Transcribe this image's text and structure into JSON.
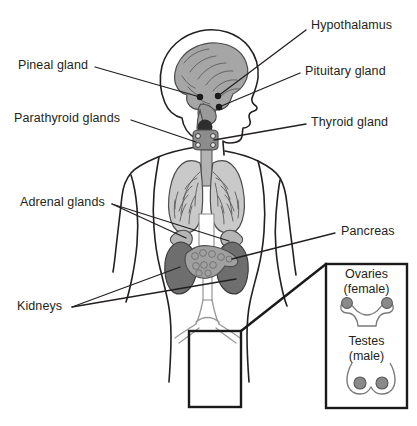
{
  "figure": {
    "type": "anatomical-diagram",
    "background_color": "#ffffff",
    "line_color": "#231f20",
    "text_color": "#231f20"
  },
  "labels": {
    "hypothalamus": "Hypothalamus",
    "pituitary_gland": "Pituitary gland",
    "thyroid_gland": "Thyroid gland",
    "pancreas": "Pancreas",
    "pineal_gland": "Pineal gland",
    "parathyroid_glands": "Parathyroid glands",
    "adrenal_glands": "Adrenal glands",
    "kidneys": "Kidneys"
  },
  "inset": {
    "ovaries_title": "Ovaries",
    "ovaries_subtitle": "(female)",
    "testes_title": "Testes",
    "testes_subtitle": "(male)"
  },
  "organ_colors": {
    "brain": "#a6a6a6",
    "lungs": "#c9c9c9",
    "thyroid": "#8c8c8c",
    "pineal_dot": "#3a3a3a",
    "kidney": "#6e6e6e",
    "adrenal": "#b5b5b5",
    "pancreas": "#a0a0a0",
    "gonad": "#8a8a8a",
    "outline": "#231f20"
  }
}
